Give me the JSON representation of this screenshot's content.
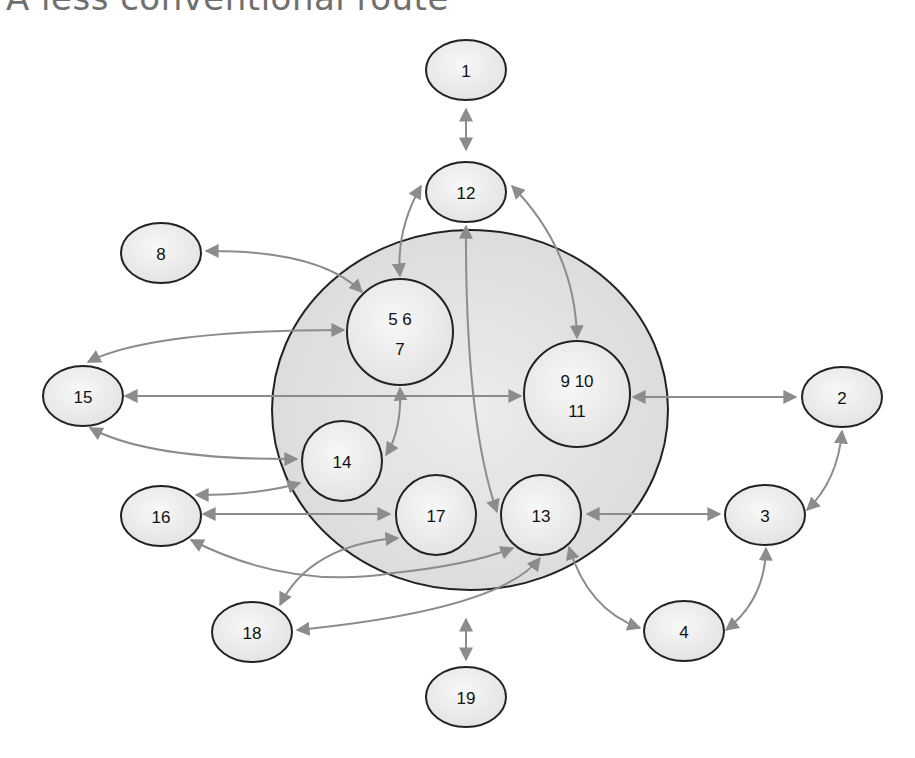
{
  "title": "A less conventional route",
  "colors": {
    "edge": "#8c8c8c",
    "node_fill": "#efefef",
    "node_stroke": "#222222",
    "big_circle_fill": "#e2e2e2"
  },
  "big_circle": {
    "cx": 470,
    "cy": 410,
    "rx": 198,
    "ry": 180
  },
  "nodes": [
    {
      "id": "1",
      "label": "1",
      "shape": "ellipse",
      "cx": 466,
      "cy": 70,
      "rx": 40,
      "ry": 30
    },
    {
      "id": "12",
      "label": "12",
      "shape": "ellipse",
      "cx": 466,
      "cy": 192,
      "rx": 40,
      "ry": 30
    },
    {
      "id": "8",
      "label": "8",
      "shape": "ellipse",
      "cx": 161,
      "cy": 253,
      "rx": 40,
      "ry": 30
    },
    {
      "id": "567",
      "label": "5 6",
      "label2": "7",
      "shape": "circle",
      "cx": 400,
      "cy": 332,
      "r": 53
    },
    {
      "id": "91011",
      "label": "9  10",
      "label2": "11",
      "shape": "circle",
      "cx": 577,
      "cy": 394,
      "r": 53
    },
    {
      "id": "15",
      "label": "15",
      "shape": "ellipse",
      "cx": 83,
      "cy": 396,
      "rx": 40,
      "ry": 30
    },
    {
      "id": "2",
      "label": "2",
      "shape": "ellipse",
      "cx": 842,
      "cy": 397,
      "rx": 40,
      "ry": 30
    },
    {
      "id": "14",
      "label": "14",
      "shape": "circle",
      "cx": 342,
      "cy": 461,
      "r": 40
    },
    {
      "id": "16",
      "label": "16",
      "shape": "ellipse",
      "cx": 161,
      "cy": 516,
      "rx": 40,
      "ry": 30
    },
    {
      "id": "17",
      "label": "17",
      "shape": "circle",
      "cx": 436,
      "cy": 515,
      "r": 40
    },
    {
      "id": "13",
      "label": "13",
      "shape": "circle",
      "cx": 541,
      "cy": 515,
      "r": 40
    },
    {
      "id": "3",
      "label": "3",
      "shape": "ellipse",
      "cx": 765,
      "cy": 515,
      "rx": 40,
      "ry": 30
    },
    {
      "id": "18",
      "label": "18",
      "shape": "ellipse",
      "cx": 252,
      "cy": 632,
      "rx": 40,
      "ry": 30
    },
    {
      "id": "4",
      "label": "4",
      "shape": "ellipse",
      "cx": 684,
      "cy": 631,
      "rx": 40,
      "ry": 30
    },
    {
      "id": "19",
      "label": "19",
      "shape": "ellipse",
      "cx": 466,
      "cy": 697,
      "rx": 40,
      "ry": 30
    }
  ],
  "edges": [
    {
      "from": "1",
      "to": "12",
      "d": "M466,109 L466,150"
    },
    {
      "from": "12",
      "to": "567",
      "d": "M421,186 Q396,230 400,276"
    },
    {
      "from": "12",
      "to": "91011",
      "d": "M512,186 Q575,250 577,338"
    },
    {
      "from": "12",
      "to": "13",
      "d": "M466,226 Q465,420 497,512"
    },
    {
      "from": "8",
      "to": "567",
      "d": "M206,251 Q320,250 362,292"
    },
    {
      "from": "15",
      "to": "567",
      "d": "M88,362 Q150,330 344,330"
    },
    {
      "from": "15",
      "to": "91011",
      "d": "M125,396 L521,396"
    },
    {
      "from": "91011",
      "to": "2",
      "d": "M633,397 L796,397"
    },
    {
      "from": "15",
      "to": "14",
      "d": "M90,428 Q150,460 297,459"
    },
    {
      "from": "567",
      "to": "14",
      "d": "M400,388 Q402,430 386,455"
    },
    {
      "from": "16",
      "to": "14",
      "d": "M196,495 Q260,495 300,483"
    },
    {
      "from": "16",
      "to": "17",
      "d": "M203,514 L390,514"
    },
    {
      "from": "16",
      "to": "13",
      "d": "M191,540 Q290,590 393,573 Q470,565 513,548"
    },
    {
      "from": "17",
      "to": "18",
      "d": "M398,538 Q310,545 280,605"
    },
    {
      "from": "13",
      "to": "18",
      "d": "M540,558 Q500,610 297,630"
    },
    {
      "from": "13",
      "to": "3",
      "d": "M587,514 L720,514"
    },
    {
      "from": "2",
      "to": "3",
      "d": "M842,431 Q838,480 807,510"
    },
    {
      "from": "13",
      "to": "4",
      "d": "M569,547 Q588,610 640,628"
    },
    {
      "from": "3",
      "to": "4",
      "d": "M766,548 Q765,600 726,630"
    },
    {
      "from": "19",
      "to": "91011",
      "d": "M466,619 L466,660"
    }
  ]
}
